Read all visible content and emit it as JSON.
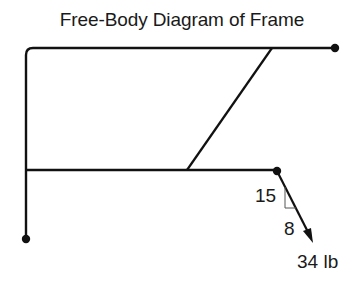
{
  "diagram": {
    "title": "Free-Body Diagram of Frame",
    "members": [
      {
        "id": "top-bar",
        "from": [
          26,
          48
        ],
        "to": [
          335,
          48
        ]
      },
      {
        "id": "left-post",
        "from": [
          26,
          48
        ],
        "to": [
          26,
          239
        ]
      },
      {
        "id": "lower-bar",
        "from": [
          26,
          170
        ],
        "to": [
          277,
          170
        ]
      },
      {
        "id": "diagonal-strut",
        "from": [
          187,
          170
        ],
        "to": [
          272,
          48
        ]
      }
    ],
    "pins": [
      {
        "id": "top-right-pin",
        "at": [
          335,
          48
        ]
      },
      {
        "id": "lower-right-pin",
        "at": [
          277,
          171
        ]
      },
      {
        "id": "bottom-left-pin",
        "at": [
          26,
          239
        ]
      }
    ],
    "load": {
      "magnitude_label": "34 lb",
      "slope_rise_label": "15",
      "slope_run_label": "8",
      "from": [
        277,
        171
      ],
      "to": [
        313,
        242
      ]
    },
    "colors": {
      "line": "#111111",
      "text": "#1a1a1a",
      "background": "#ffffff"
    }
  }
}
